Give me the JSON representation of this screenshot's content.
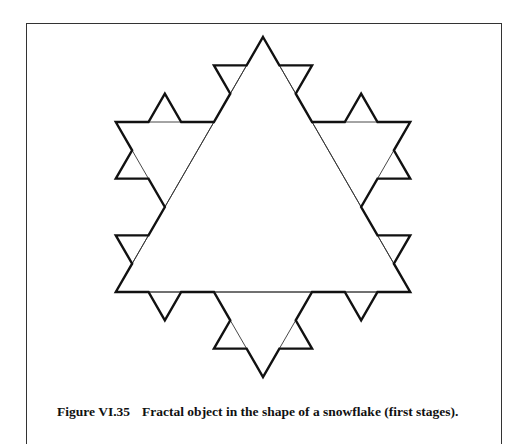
{
  "figure": {
    "label": "Figure VI.35",
    "caption": "Fractal object in the shape of a snowflake (first stages).",
    "diagram": {
      "type": "koch-snowflake",
      "center": [
        263,
        207
      ],
      "radius": 170,
      "levels_shown": [
        0,
        1,
        2
      ],
      "outline_level": 2,
      "outline_color": "#111111",
      "inner_line_color": "#333333"
    }
  }
}
